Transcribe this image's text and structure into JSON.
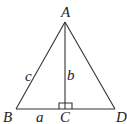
{
  "diagram": {
    "type": "geometry-triangle",
    "vertices": {
      "A": "A",
      "B": "B",
      "C": "C",
      "D": "D"
    },
    "side_labels": {
      "AB": "c",
      "AC": "b",
      "BC": "a"
    },
    "right_angle_at": "C",
    "colors": {
      "line": "#333333",
      "text": "#222222",
      "background": "#ffffff"
    }
  }
}
